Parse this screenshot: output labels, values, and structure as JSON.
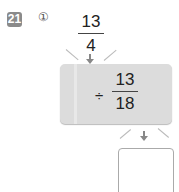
{
  "problem": {
    "number": "21",
    "sub_label": "①",
    "input_fraction": {
      "numerator": "13",
      "denominator": "4"
    },
    "operation": {
      "operator": "÷",
      "operand": {
        "numerator": "13",
        "denominator": "18"
      }
    },
    "answer": ""
  },
  "colors": {
    "badge": "#8a8a8a",
    "op_box": "#dcdcdc",
    "arrow": "#888888"
  }
}
